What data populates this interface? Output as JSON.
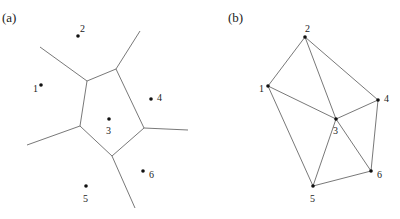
{
  "panels": [
    {
      "label": "(a)",
      "kind": "voronoi",
      "points": [
        {
          "id": "1",
          "x": 41,
          "y": 85,
          "lx": 33,
          "ly": 92
        },
        {
          "id": "2",
          "x": 78,
          "y": 36,
          "lx": 80,
          "ly": 32
        },
        {
          "id": "3",
          "x": 109,
          "y": 119,
          "lx": 106,
          "ly": 134
        },
        {
          "id": "4",
          "x": 151,
          "y": 99,
          "lx": 157,
          "ly": 101
        },
        {
          "id": "5",
          "x": 86,
          "y": 186,
          "lx": 83,
          "ly": 202
        },
        {
          "id": "6",
          "x": 143,
          "y": 171,
          "lx": 149,
          "ly": 178
        }
      ],
      "vertices": {
        "A": [
          87,
          81
        ],
        "B": [
          116,
          69
        ],
        "C": [
          144,
          128
        ],
        "D": [
          112,
          156
        ],
        "E": [
          80,
          126
        ]
      },
      "edges": [
        [
          [
            87,
            81
          ],
          [
            116,
            69
          ]
        ],
        [
          [
            116,
            69
          ],
          [
            144,
            128
          ]
        ],
        [
          [
            144,
            128
          ],
          [
            112,
            156
          ]
        ],
        [
          [
            112,
            156
          ],
          [
            80,
            126
          ]
        ],
        [
          [
            80,
            126
          ],
          [
            87,
            81
          ]
        ],
        [
          [
            87,
            81
          ],
          [
            40,
            47
          ]
        ],
        [
          [
            116,
            69
          ],
          [
            140,
            31
          ]
        ],
        [
          [
            144,
            128
          ],
          [
            188,
            130
          ]
        ],
        [
          [
            112,
            156
          ],
          [
            135,
            208
          ]
        ],
        [
          [
            80,
            126
          ],
          [
            27,
            145
          ]
        ]
      ]
    },
    {
      "label": "(b)",
      "kind": "delaunay",
      "points": [
        {
          "id": "1",
          "x": 268,
          "y": 86,
          "lx": 259,
          "ly": 92
        },
        {
          "id": "2",
          "x": 305,
          "y": 37,
          "lx": 305,
          "ly": 32
        },
        {
          "id": "3",
          "x": 336,
          "y": 119,
          "lx": 333,
          "ly": 134
        },
        {
          "id": "4",
          "x": 378,
          "y": 100,
          "lx": 384,
          "ly": 102
        },
        {
          "id": "5",
          "x": 313,
          "y": 186,
          "lx": 310,
          "ly": 202
        },
        {
          "id": "6",
          "x": 371,
          "y": 171,
          "lx": 377,
          "ly": 178
        }
      ],
      "edges": [
        [
          "1",
          "2"
        ],
        [
          "2",
          "4"
        ],
        [
          "2",
          "3"
        ],
        [
          "1",
          "3"
        ],
        [
          "3",
          "4"
        ],
        [
          "1",
          "5"
        ],
        [
          "3",
          "5"
        ],
        [
          "3",
          "6"
        ],
        [
          "4",
          "6"
        ],
        [
          "5",
          "6"
        ]
      ]
    }
  ],
  "panel_label_positions": [
    {
      "x": 2,
      "y": 22
    },
    {
      "x": 228,
      "y": 22
    }
  ]
}
